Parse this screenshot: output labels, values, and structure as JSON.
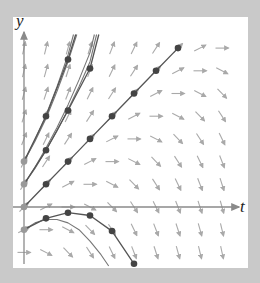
{
  "figure": {
    "axes": {
      "x_label": "t",
      "y_label": "y"
    },
    "colors": {
      "background": "#c9c9c9",
      "panel": "#ffffff",
      "axis": "#8a8a8a",
      "arrow": "#a9a9a9",
      "euler_line": "#555555",
      "euler_point": "#444444",
      "initial_point": "#999999",
      "exact_curve": "#777777"
    }
  },
  "chart_data": {
    "type": "line",
    "title": "",
    "xlabel": "t",
    "ylabel": "y",
    "grid": false,
    "xlim": [
      -0.5,
      10
    ],
    "ylim": [
      -2.6,
      7.7
    ],
    "slope_field": {
      "equation": "dy/dt = 1 + 0.5 (y - t)",
      "t_values": [
        0,
        1,
        2,
        3,
        4,
        5,
        6,
        7,
        8,
        9
      ],
      "y_values": [
        -2,
        -1,
        0,
        1,
        2,
        3,
        4,
        5,
        6,
        7
      ],
      "coef_const": 1,
      "coef_y": 0.5,
      "coef_t": -0.5
    },
    "series": [
      {
        "name": "Euler from y(0)=2",
        "points": [
          [
            0,
            2
          ],
          [
            1,
            4
          ],
          [
            2,
            6.5
          ],
          [
            2.35,
            7.6
          ]
        ]
      },
      {
        "name": "Euler from y(0)=1",
        "points": [
          [
            0,
            1
          ],
          [
            1,
            2.5
          ],
          [
            2,
            4.25
          ],
          [
            3,
            6.1
          ],
          [
            3.4,
            7.6
          ]
        ]
      },
      {
        "name": "Euler from y(0)=0 (y = t)",
        "points": [
          [
            0,
            0
          ],
          [
            1,
            1
          ],
          [
            2,
            2
          ],
          [
            3,
            3
          ],
          [
            4,
            4
          ],
          [
            5,
            5
          ],
          [
            6,
            6
          ],
          [
            7,
            7
          ]
        ]
      },
      {
        "name": "Euler from y(0)=-1",
        "points": [
          [
            0,
            -1
          ],
          [
            1,
            -0.5
          ],
          [
            2,
            -0.25
          ],
          [
            3,
            -0.375
          ],
          [
            4,
            -1.06
          ],
          [
            5,
            -2.5
          ]
        ]
      }
    ],
    "exact_curves": [
      {
        "name": "exact y(0)=2",
        "points": [
          [
            0,
            2
          ],
          [
            0.5,
            2.9
          ],
          [
            1,
            3.9
          ],
          [
            1.5,
            5.1
          ],
          [
            2,
            6.4
          ],
          [
            2.4,
            7.6
          ]
        ]
      },
      {
        "name": "exact y(0)=2 (b)",
        "points": [
          [
            0,
            2
          ],
          [
            0.5,
            2.95
          ],
          [
            1,
            4.05
          ],
          [
            1.5,
            5.3
          ],
          [
            2,
            6.7
          ],
          [
            2.25,
            7.6
          ]
        ]
      },
      {
        "name": "exact y(0)=1",
        "points": [
          [
            0,
            1
          ],
          [
            0.5,
            1.7
          ],
          [
            1,
            2.5
          ],
          [
            1.5,
            3.35
          ],
          [
            2,
            4.3
          ],
          [
            2.5,
            5.3
          ],
          [
            3,
            6.4
          ],
          [
            3.3,
            7.6
          ]
        ]
      },
      {
        "name": "exact y(0)=1 (b)",
        "points": [
          [
            0,
            1
          ],
          [
            0.5,
            1.75
          ],
          [
            1,
            2.6
          ],
          [
            1.5,
            3.5
          ],
          [
            2,
            4.5
          ],
          [
            2.5,
            5.6
          ],
          [
            3,
            6.8
          ],
          [
            3.2,
            7.6
          ]
        ]
      },
      {
        "name": "exact y(0)=-1",
        "points": [
          [
            0,
            -1
          ],
          [
            0.5,
            -0.7
          ],
          [
            1,
            -0.55
          ],
          [
            1.5,
            -0.55
          ],
          [
            2,
            -0.7
          ],
          [
            2.5,
            -1.0
          ],
          [
            3,
            -1.5
          ],
          [
            3.5,
            -2.1
          ],
          [
            3.85,
            -2.6
          ]
        ]
      }
    ],
    "initial_points": [
      [
        0,
        2
      ],
      [
        0,
        1
      ],
      [
        0,
        0
      ],
      [
        0,
        -1
      ]
    ]
  },
  "layout": {
    "origin_px": [
      11,
      190
    ],
    "unit_px_x": 22,
    "unit_px_y": 22.7,
    "arrow_len_px": 13
  }
}
